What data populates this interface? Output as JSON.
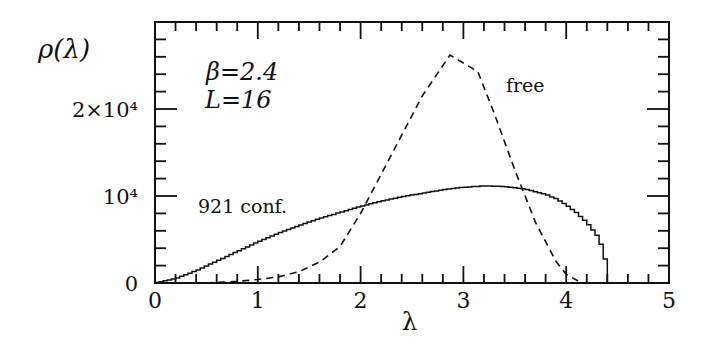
{
  "chart_data": {
    "type": "line",
    "title": "",
    "xlabel": "λ",
    "ylabel": "ρ(λ)",
    "xlim": [
      0,
      5
    ],
    "ylim": [
      0,
      30000
    ],
    "x_ticks": [
      0,
      1,
      2,
      3,
      4,
      5
    ],
    "x_tick_labels": [
      "0",
      "1",
      "2",
      "3",
      "4",
      "5"
    ],
    "y_ticks": [
      0,
      10000,
      20000
    ],
    "y_tick_labels": [
      "0",
      "10⁴",
      "2×10⁴"
    ],
    "grid": false,
    "annotations": [
      {
        "text": "β=2.4",
        "x": 0.6,
        "y": 24500
      },
      {
        "text": "L=16",
        "x": 0.6,
        "y": 20500
      },
      {
        "text": "free",
        "x": 3.45,
        "y": 24000
      },
      {
        "text": "921 conf.",
        "x": 0.45,
        "y": 10000
      }
    ],
    "series": [
      {
        "name": "921 conf.",
        "style": "solid-histogram",
        "x": [
          0,
          0.2,
          0.4,
          0.6,
          0.8,
          1.0,
          1.2,
          1.4,
          1.6,
          1.8,
          2.0,
          2.2,
          2.4,
          2.6,
          2.8,
          3.0,
          3.2,
          3.4,
          3.6,
          3.8,
          3.9,
          4.0,
          4.1,
          4.2,
          4.3,
          4.35,
          4.4,
          4.42
        ],
        "values": [
          0,
          500,
          1400,
          2500,
          3600,
          4700,
          5700,
          6600,
          7400,
          8100,
          8800,
          9400,
          9900,
          10300,
          10700,
          11000,
          11150,
          11100,
          10800,
          10200,
          9700,
          9000,
          8100,
          7000,
          5500,
          4200,
          1800,
          0
        ]
      },
      {
        "name": "free",
        "style": "dashed",
        "x": [
          0.5,
          0.8,
          1.0,
          1.2,
          1.4,
          1.6,
          1.8,
          2.0,
          2.2,
          2.4,
          2.6,
          2.87,
          3.14,
          3.3,
          3.5,
          3.7,
          3.9,
          4.0,
          4.15
        ],
        "values": [
          0,
          200,
          400,
          700,
          1300,
          2400,
          4200,
          8000,
          12500,
          17000,
          21500,
          26200,
          24300,
          19500,
          13000,
          7000,
          2500,
          1000,
          0
        ]
      }
    ]
  }
}
